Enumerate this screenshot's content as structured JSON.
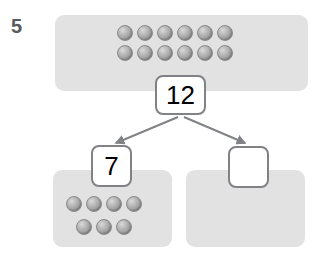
{
  "worksheet": {
    "question_number": "5",
    "type": "number-bond",
    "total_panel": {
      "name": "whole-counter-panel",
      "counter_count": 12,
      "rows": [
        6,
        6
      ],
      "counter_color": "#a3a3a3",
      "panel_color": "#e2e2e2"
    },
    "part_left_panel": {
      "name": "part-left-counter-panel",
      "counter_count": 7,
      "rows": [
        4,
        3
      ],
      "counter_color": "#a3a3a3",
      "panel_color": "#e2e2e2"
    },
    "part_right_panel": {
      "name": "part-right-counter-panel",
      "counter_count": 0,
      "rows": [],
      "counter_color": "#a3a3a3",
      "panel_color": "#e2e2e2"
    },
    "boxes": {
      "total": {
        "label": "whole-number-box",
        "value": "12",
        "filled": true
      },
      "part_left": {
        "label": "part-number-box-left",
        "value": "7",
        "filled": true
      },
      "part_right": {
        "label": "part-number-box-right",
        "value": "",
        "filled": false
      }
    },
    "arrows": {
      "color": "#808285",
      "left_arrow": "whole-to-part-left",
      "right_arrow": "whole-to-part-right"
    }
  }
}
